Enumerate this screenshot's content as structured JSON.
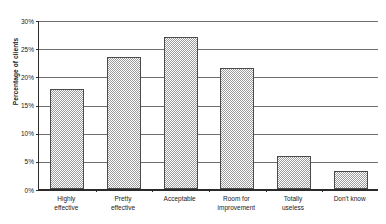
{
  "chart_data": {
    "type": "bar",
    "title": "",
    "xlabel": "",
    "ylabel": "Percentage of clients",
    "ylim": [
      0,
      30
    ],
    "ytick_labels": [
      "30%",
      "25%",
      "20%",
      "15%",
      "10%",
      "5%",
      "0%"
    ],
    "ytick_values": [
      30,
      25,
      20,
      15,
      10,
      5,
      0
    ],
    "grid": true,
    "legend": "none",
    "categories": [
      "Highly effective",
      "Pretty effective",
      "Acceptable",
      "Room for improvement",
      "Totally useless",
      "Don't know"
    ],
    "category_lines": [
      [
        "Highly",
        "effective"
      ],
      [
        "Pretty",
        "effective"
      ],
      [
        "Acceptable",
        ""
      ],
      [
        "Room for",
        "improvement"
      ],
      [
        "Totally",
        "useless"
      ],
      [
        "Don't know",
        ""
      ]
    ],
    "values": [
      17.8,
      23.4,
      27.0,
      21.5,
      5.8,
      3.2
    ],
    "value_unit": "%",
    "bar_fill": "#9c9c9c",
    "bar_border": "#4a4a4a",
    "axis_color": "#2a2a2a",
    "gridline_color": "#6e6e6e",
    "background": "#ffffff"
  },
  "axis": {
    "y_title": "Percentage of clients"
  },
  "title": {
    "text": ""
  }
}
